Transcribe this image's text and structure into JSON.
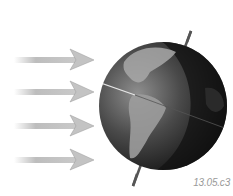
{
  "figure": {
    "arrows": [
      {
        "y": 60
      },
      {
        "y": 92
      },
      {
        "y": 126
      },
      {
        "y": 160
      }
    ],
    "arrow_color": "#b9b9b9",
    "globe_color": "#3a3a3a",
    "label": "13.05.c3"
  }
}
